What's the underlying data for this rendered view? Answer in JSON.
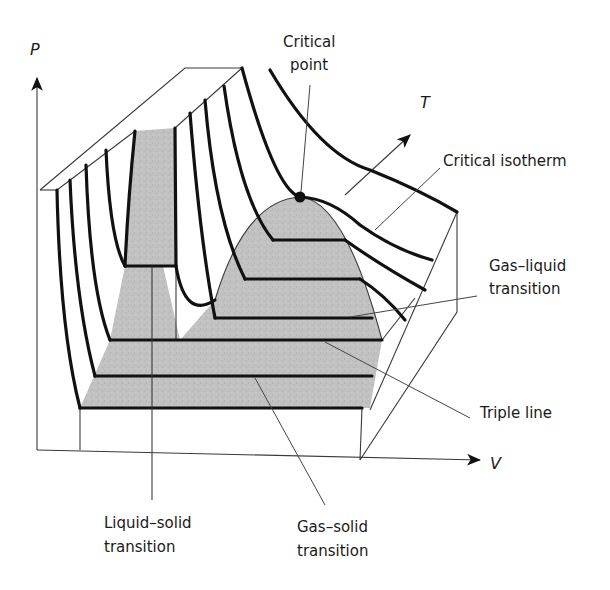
{
  "diagram": {
    "colors": {
      "line": "#111111",
      "thin_line": "#3a3a3a",
      "two_phase_fill": "#bdbdbd",
      "background": "#ffffff"
    },
    "axes": {
      "p": "P",
      "v": "V",
      "t": "T"
    },
    "labels": {
      "critical_point_line1": "Critical",
      "critical_point_line2": "point",
      "critical_isotherm": "Critical isotherm",
      "gas_liquid_line1": "Gas–liquid",
      "gas_liquid_line2": "transition",
      "triple_line": "Triple line",
      "liquid_solid_line1": "Liquid–solid",
      "liquid_solid_line2": "transition",
      "gas_solid_line1": "Gas–solid",
      "gas_solid_line2": "transition"
    },
    "regions": [
      "solid–liquid coexistence (gray column)",
      "liquid–gas coexistence dome (gray)",
      "solid–gas coexistence (gray, below triple line)"
    ],
    "markers": {
      "critical_point": "filled-dot"
    }
  }
}
